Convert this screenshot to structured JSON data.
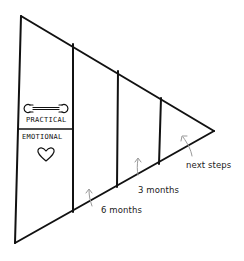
{
  "diagram": {
    "type": "funnel-triangle",
    "colors": {
      "line": "#111111",
      "arrow": "#999999",
      "text": "#222222",
      "background": "#ffffff"
    },
    "sections": [
      {
        "id": "base",
        "rows": [
          {
            "label": "PRACTICAL",
            "icon": "wrench-icon"
          },
          {
            "label": "EMOTIONAL",
            "icon": "heart-icon"
          }
        ]
      },
      {
        "id": "section-2"
      },
      {
        "id": "section-3"
      },
      {
        "id": "section-4"
      }
    ],
    "timeline_labels": [
      {
        "label": "6 months"
      },
      {
        "label": "3 months"
      },
      {
        "label": "next steps"
      }
    ]
  }
}
